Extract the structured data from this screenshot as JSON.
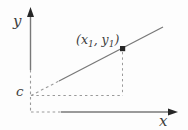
{
  "diagram": {
    "labels": {
      "y_axis": "y",
      "x_axis": "x",
      "intercept": "c",
      "point": {
        "pre": "(x",
        "sub1": "1",
        "mid": ", y",
        "sub2": "1",
        "post": ")"
      }
    },
    "colors": {
      "background": "#fdfdfd",
      "line": "#787878",
      "dashed": "#9a9a9a",
      "ink": "#262626",
      "text": "#3d3d3d"
    }
  }
}
